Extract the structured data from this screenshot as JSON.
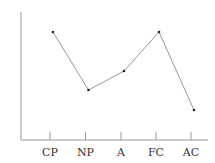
{
  "chart_data": {
    "type": "line",
    "title": "",
    "xlabel": "",
    "ylabel": "",
    "categories": [
      "CP",
      "NP",
      "A",
      "FC",
      "AC"
    ],
    "series": [
      {
        "name": "",
        "values": [
          108,
          50,
          69,
          108,
          30
        ]
      }
    ],
    "ylim": [
      0,
      128
    ],
    "grid": false,
    "legend": null,
    "markers": true,
    "colors": {
      "line": "#999999",
      "marker": "#222222",
      "axis": "#999999",
      "text": "#333333"
    }
  }
}
